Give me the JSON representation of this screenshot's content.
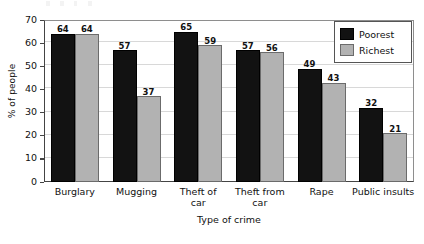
{
  "chart_data": {
    "type": "bar",
    "title": "",
    "xlabel": "Type of crime",
    "ylabel": "% of people",
    "categories": [
      "Burglary",
      "Mugging",
      "Theft of car",
      "Theft from car",
      "Rape",
      "Public insults"
    ],
    "category_lines": [
      [
        "Burglary"
      ],
      [
        "Mugging"
      ],
      [
        "Theft of",
        "car"
      ],
      [
        "Theft from",
        "car"
      ],
      [
        "Rape"
      ],
      [
        "Public insults"
      ]
    ],
    "series": [
      {
        "name": "Poorest",
        "color": "#121212",
        "values": [
          64,
          57,
          65,
          57,
          49,
          32
        ]
      },
      {
        "name": "Richest",
        "color": "#b2b2b2",
        "values": [
          64,
          37,
          59,
          56,
          43,
          21
        ]
      }
    ],
    "ylim": [
      0,
      70
    ],
    "ytick_step": 10,
    "yticks": [
      0,
      10,
      20,
      30,
      40,
      50,
      60,
      70
    ],
    "ytick_labels": [
      "0",
      "10",
      "20",
      "30",
      "40",
      "50",
      "60",
      "70"
    ],
    "grid": "horizontal",
    "legend_position": "top-right-inside",
    "data_labels": true
  },
  "legend": {
    "entries": [
      {
        "label": "Poorest",
        "swatch": "black-square-swatch"
      },
      {
        "label": "Richest",
        "swatch": "gray-square-swatch"
      }
    ]
  },
  "axes": {
    "y_title": "% of people",
    "x_title": "Type of crime"
  }
}
